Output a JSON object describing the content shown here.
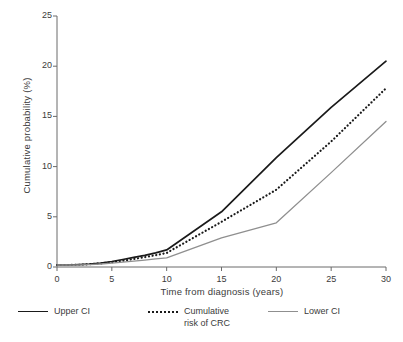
{
  "chart_data": {
    "type": "line",
    "title": "",
    "subtitle": "",
    "xlabel": "Time from diagnosis (years)",
    "ylabel": "Cumulative probability (%)",
    "xlim": [
      0,
      30
    ],
    "ylim": [
      0,
      25
    ],
    "xticks": [
      0,
      5,
      10,
      15,
      20,
      25,
      30
    ],
    "yticks": [
      0,
      5,
      10,
      15,
      20,
      25
    ],
    "xtick_labels": [
      "0",
      "5",
      "10",
      "15",
      "20",
      "25",
      "30"
    ],
    "ytick_labels": [
      "0",
      "5",
      "10",
      "15",
      "20",
      "25"
    ],
    "grid": false,
    "legend_position": "below",
    "x": [
      0,
      1,
      2,
      3,
      4,
      5,
      6,
      7,
      8,
      9,
      10,
      15,
      20,
      25,
      30
    ],
    "series": [
      {
        "name": "Upper CI",
        "style": "solid",
        "color": "#1a1a1a",
        "values": [
          0.2,
          0.2,
          0.25,
          0.3,
          0.4,
          0.55,
          0.75,
          0.95,
          1.15,
          1.4,
          1.7,
          5.5,
          10.9,
          15.9,
          20.5
        ]
      },
      {
        "name": "Cumulative risk of CRC",
        "style": "dotted",
        "color": "#1a1a1a",
        "values": [
          0.2,
          0.2,
          0.22,
          0.28,
          0.36,
          0.48,
          0.62,
          0.8,
          0.98,
          1.18,
          1.4,
          4.5,
          7.7,
          12.5,
          17.8
        ]
      },
      {
        "name": "Lower CI",
        "style": "solid",
        "color": "#8f8f8f",
        "values": [
          0.2,
          0.2,
          0.2,
          0.24,
          0.3,
          0.38,
          0.48,
          0.58,
          0.68,
          0.8,
          0.9,
          2.9,
          4.4,
          9.4,
          14.5
        ]
      }
    ]
  },
  "legend": {
    "items": [
      {
        "label": "Upper CI",
        "swatch": "solid-dark"
      },
      {
        "label": "Cumulative\nrisk of CRC",
        "swatch": "dotted"
      },
      {
        "label": "Lower CI",
        "swatch": "solid-gray"
      }
    ]
  },
  "colors": {
    "upper_ci": "#1a1a1a",
    "cumulative_risk": "#1a1a1a",
    "lower_ci": "#8f8f8f",
    "axis": "#6b6b6b",
    "text": "#3b3b3b"
  }
}
